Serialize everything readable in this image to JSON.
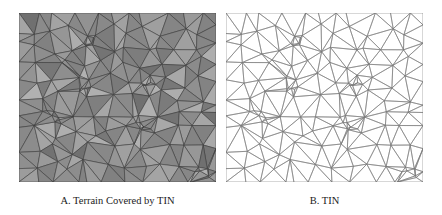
{
  "figure": {
    "panels": [
      {
        "id": "A",
        "caption": "A. Terrain Covered by TIN",
        "description": "Grayscale shaded terrain surface overlaid with a triangulated irregular network mesh",
        "fill_color": "#8e8e8e",
        "edge_color": "#3a3a3a"
      },
      {
        "id": "B",
        "caption": "B. TIN",
        "description": "Triangulated irregular network mesh (edges only) on white background",
        "fill_color": "#ffffff",
        "edge_color": "#7a7a7a"
      }
    ]
  }
}
